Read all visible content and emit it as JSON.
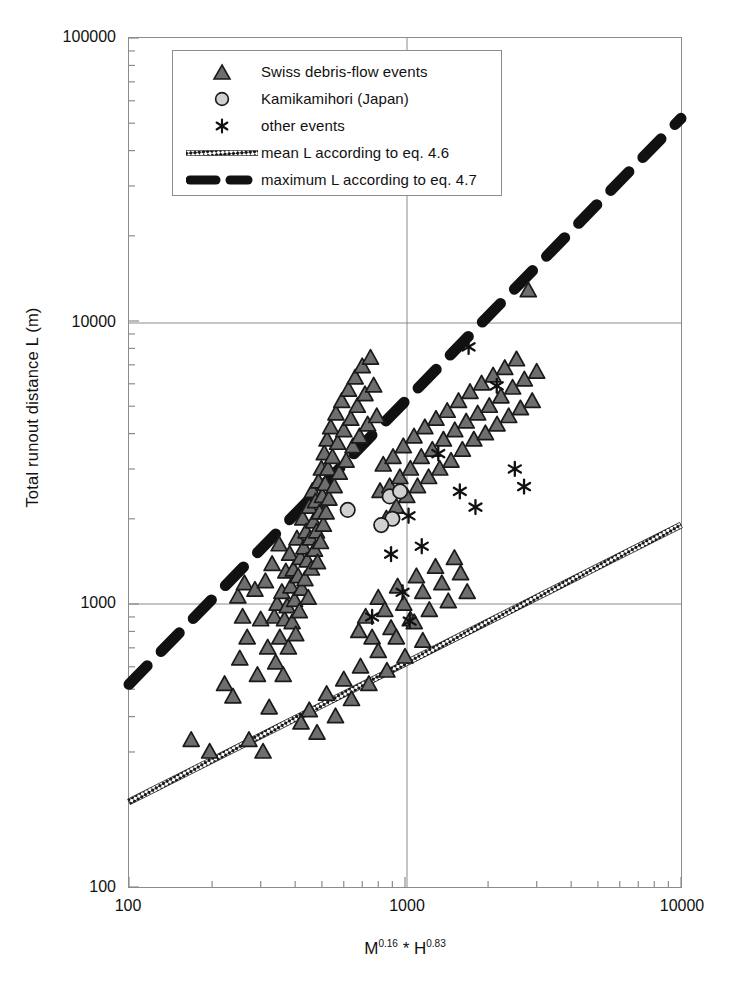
{
  "chart_data": {
    "type": "scatter",
    "title": "",
    "xlabel": "M0.16 * H0.83",
    "xlabel_parts": {
      "base1": "M",
      "exp1": "0.16",
      "operator": " * ",
      "base2": "H",
      "exp2": "0.83"
    },
    "ylabel": "Total runout distance L (m)",
    "xscale": "log",
    "yscale": "log",
    "xlim": [
      100,
      10000
    ],
    "ylim": [
      100,
      100000
    ],
    "xticks": [
      100,
      1000,
      10000
    ],
    "xtick_labels": [
      "100",
      "1000",
      "10000"
    ],
    "yticks": [
      100,
      1000,
      10000,
      100000
    ],
    "ytick_labels": [
      "100",
      "1000",
      "10000",
      "100000"
    ],
    "grid": "major gridlines at x=1000, y=1000 and y=10000",
    "legend_position": "top-left inside axes",
    "legend": [
      {
        "key": "triangle",
        "label": "Swiss debris-flow events"
      },
      {
        "key": "circle",
        "label": "Kamikamihori (Japan)"
      },
      {
        "key": "asterisk",
        "label": "other events"
      },
      {
        "key": "dotted-line",
        "label": "mean L  according to eq. 4.6"
      },
      {
        "key": "dashed-line",
        "label": "maximum L according to eq. 4.7"
      }
    ],
    "series": [
      {
        "name": "Swiss debris-flow events",
        "marker": "triangle",
        "color": "#6e6e6e",
        "edge_color": "#1a1a1a",
        "points": [
          [
            168,
            330
          ],
          [
            196,
            300
          ],
          [
            222,
            520
          ],
          [
            238,
            470
          ],
          [
            248,
            1060
          ],
          [
            252,
            640
          ],
          [
            258,
            900
          ],
          [
            262,
            1180
          ],
          [
            268,
            760
          ],
          [
            272,
            330
          ],
          [
            286,
            1120
          ],
          [
            292,
            560
          ],
          [
            300,
            880
          ],
          [
            306,
            300
          ],
          [
            312,
            1200
          ],
          [
            318,
            700
          ],
          [
            322,
            430
          ],
          [
            330,
            1380
          ],
          [
            336,
            900
          ],
          [
            340,
            620
          ],
          [
            344,
            1000
          ],
          [
            350,
            1620
          ],
          [
            352,
            760
          ],
          [
            358,
            1100
          ],
          [
            362,
            560
          ],
          [
            366,
            880
          ],
          [
            370,
            1300
          ],
          [
            374,
            980
          ],
          [
            378,
            700
          ],
          [
            382,
            1500
          ],
          [
            386,
            1150
          ],
          [
            390,
            860
          ],
          [
            394,
            1320
          ],
          [
            398,
            1030
          ],
          [
            402,
            780
          ],
          [
            406,
            1700
          ],
          [
            410,
            1250
          ],
          [
            414,
            940
          ],
          [
            418,
            1450
          ],
          [
            422,
            1130
          ],
          [
            426,
            2000
          ],
          [
            430,
            1580
          ],
          [
            434,
            1220
          ],
          [
            438,
            1800
          ],
          [
            442,
            1420
          ],
          [
            446,
            1050
          ],
          [
            450,
            2200
          ],
          [
            454,
            1700
          ],
          [
            458,
            1330
          ],
          [
            462,
            2500
          ],
          [
            466,
            1950
          ],
          [
            470,
            1550
          ],
          [
            474,
            2300
          ],
          [
            478,
            1800
          ],
          [
            482,
            1400
          ],
          [
            486,
            2700
          ],
          [
            490,
            2100
          ],
          [
            494,
            1650
          ],
          [
            498,
            3000
          ],
          [
            502,
            2400
          ],
          [
            506,
            1900
          ],
          [
            510,
            3400
          ],
          [
            514,
            2650
          ],
          [
            518,
            2100
          ],
          [
            522,
            3800
          ],
          [
            526,
            3000
          ],
          [
            530,
            2350
          ],
          [
            538,
            4200
          ],
          [
            546,
            3300
          ],
          [
            554,
            2600
          ],
          [
            562,
            4700
          ],
          [
            570,
            3700
          ],
          [
            578,
            2900
          ],
          [
            590,
            5200
          ],
          [
            600,
            4100
          ],
          [
            612,
            3200
          ],
          [
            624,
            5700
          ],
          [
            636,
            4500
          ],
          [
            648,
            3600
          ],
          [
            660,
            6300
          ],
          [
            672,
            5000
          ],
          [
            684,
            3900
          ],
          [
            700,
            6900
          ],
          [
            716,
            5500
          ],
          [
            732,
            4300
          ],
          [
            750,
            7400
          ],
          [
            770,
            5900
          ],
          [
            790,
            4600
          ],
          [
            812,
            2500
          ],
          [
            834,
            3100
          ],
          [
            856,
            2000
          ],
          [
            880,
            2600
          ],
          [
            905,
            3300
          ],
          [
            930,
            2200
          ],
          [
            958,
            2800
          ],
          [
            986,
            3600
          ],
          [
            1015,
            2400
          ],
          [
            1046,
            3000
          ],
          [
            1078,
            3900
          ],
          [
            1110,
            2600
          ],
          [
            1145,
            3300
          ],
          [
            1180,
            4200
          ],
          [
            1218,
            2800
          ],
          [
            1256,
            3500
          ],
          [
            1295,
            4500
          ],
          [
            1336,
            3000
          ],
          [
            1378,
            3800
          ],
          [
            1422,
            4800
          ],
          [
            1468,
            3200
          ],
          [
            1515,
            4100
          ],
          [
            1563,
            5200
          ],
          [
            1614,
            3500
          ],
          [
            1666,
            4400
          ],
          [
            1720,
            5600
          ],
          [
            1776,
            3800
          ],
          [
            1834,
            4700
          ],
          [
            1894,
            6000
          ],
          [
            1956,
            4000
          ],
          [
            2020,
            5000
          ],
          [
            2086,
            6400
          ],
          [
            2155,
            4300
          ],
          [
            2226,
            5400
          ],
          [
            2299,
            6800
          ],
          [
            2375,
            4600
          ],
          [
            2454,
            5800
          ],
          [
            2535,
            7300
          ],
          [
            2620,
            4900
          ],
          [
            2707,
            6200
          ],
          [
            2797,
            12800
          ],
          [
            2890,
            5200
          ],
          [
            3000,
            6600
          ],
          [
            680,
            800
          ],
          [
            720,
            900
          ],
          [
            760,
            760
          ],
          [
            800,
            1050
          ],
          [
            845,
            950
          ],
          [
            890,
            820
          ],
          [
            940,
            1150
          ],
          [
            990,
            1000
          ],
          [
            1045,
            880
          ],
          [
            1100,
            1250
          ],
          [
            1160,
            1100
          ],
          [
            1225,
            950
          ],
          [
            1290,
            1350
          ],
          [
            1360,
            1180
          ],
          [
            1435,
            1020
          ],
          [
            1510,
            1450
          ],
          [
            1590,
            1280
          ],
          [
            1680,
            1100
          ],
          [
            420,
            380
          ],
          [
            450,
            420
          ],
          [
            480,
            350
          ],
          [
            520,
            480
          ],
          [
            560,
            400
          ],
          [
            600,
            540
          ],
          [
            640,
            460
          ],
          [
            690,
            600
          ],
          [
            740,
            520
          ],
          [
            800,
            680
          ],
          [
            860,
            580
          ],
          [
            930,
            760
          ],
          [
            1000,
            650
          ],
          [
            1080,
            860
          ],
          [
            1160,
            740
          ]
        ]
      },
      {
        "name": "Kamikamihori (Japan)",
        "marker": "circle",
        "color": "#d0d0d0",
        "edge_color": "#1a1a1a",
        "points": [
          [
            620,
            2150
          ],
          [
            880,
            2400
          ],
          [
            960,
            2500
          ],
          [
            900,
            2000
          ],
          [
            820,
            1900
          ]
        ]
      },
      {
        "name": "other events",
        "marker": "asterisk",
        "color": "#111111",
        "points": [
          [
            760,
            900
          ],
          [
            980,
            1100
          ],
          [
            1040,
            870
          ],
          [
            1320,
            3400
          ],
          [
            1580,
            2500
          ],
          [
            1700,
            8100
          ],
          [
            1800,
            2200
          ],
          [
            2150,
            5900
          ],
          [
            2500,
            3000
          ],
          [
            2700,
            2600
          ],
          [
            1150,
            1600
          ],
          [
            890,
            1500
          ],
          [
            1030,
            2050
          ]
        ]
      }
    ],
    "lines": [
      {
        "name": "mean L according to eq. 4.6",
        "style": "dotted-thick",
        "color": "#222222",
        "equation": "eq. 4.6",
        "endpoints": [
          [
            100,
            200
          ],
          [
            10000,
            1900
          ]
        ]
      },
      {
        "name": "maximum L according to eq. 4.7",
        "style": "dashed-thick",
        "color": "#111111",
        "equation": "eq. 4.7",
        "endpoints": [
          [
            100,
            520
          ],
          [
            10000,
            52000
          ]
        ]
      }
    ]
  }
}
